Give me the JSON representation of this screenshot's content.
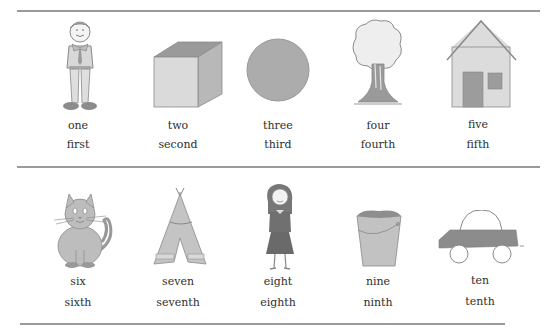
{
  "rows": [
    {
      "items": [
        {
          "picture": "boy-icon",
          "cardinal": "one",
          "ordinal": "first"
        },
        {
          "picture": "box-icon",
          "cardinal": "two",
          "ordinal": "second"
        },
        {
          "picture": "circle-icon",
          "cardinal": "three",
          "ordinal": "third"
        },
        {
          "picture": "tree-icon",
          "cardinal": "four",
          "ordinal": "fourth"
        },
        {
          "picture": "house-icon",
          "cardinal": "five",
          "ordinal": "fifth"
        }
      ]
    },
    {
      "items": [
        {
          "picture": "cat-icon",
          "cardinal": "six",
          "ordinal": "sixth"
        },
        {
          "picture": "tepee-icon",
          "cardinal": "seven",
          "ordinal": "seventh"
        },
        {
          "picture": "girl-icon",
          "cardinal": "eight",
          "ordinal": "eighth"
        },
        {
          "picture": "bucket-icon",
          "cardinal": "nine",
          "ordinal": "ninth"
        },
        {
          "picture": "car-icon",
          "cardinal": "ten",
          "ordinal": "tenth"
        }
      ]
    }
  ],
  "colors": {
    "rule": "#9a9a9a",
    "fill_light": "#d9d9d9",
    "fill_mid": "#b0b0b0",
    "fill_dark": "#8a8a8a",
    "text": "#2e2e2e"
  }
}
